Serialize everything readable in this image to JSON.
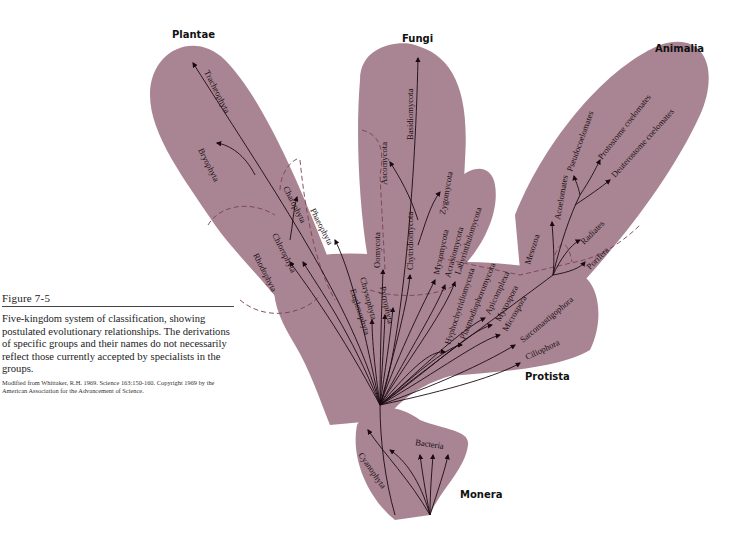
{
  "figure": {
    "title": "Figure 7-5",
    "caption": "Five-kingdom system of classification, showing postulated evolutionary relationships. The derivations of specific groups and their names do not necessarily reflect those currently accepted by specialists in the groups.",
    "source": "Modified from Whittaker, R.H. 1969. Science 163:150-160. Copyright 1969 by the American Association for the Advancement of Science."
  },
  "colors": {
    "kingdom_fill": "#a98593",
    "branch_line": "#1a0a10",
    "boundary_dash": "#7a4050"
  },
  "kingdoms": {
    "plantae": "Plantae",
    "fungi": "Fungi",
    "animalia": "Animalia",
    "protista": "Protista",
    "monera": "Monera"
  },
  "taxa": {
    "plantae": [
      "Tracheophyta",
      "Bryophyta",
      "Charophyta",
      "Chlorophyta",
      "Rhodophyta",
      "Phaeophyta"
    ],
    "fungi": [
      "Basidiomycota",
      "Ascomycota",
      "Zygomycota",
      "Chytridiomycota",
      "Oomycota"
    ],
    "fungi_like": [
      "Myxomycota",
      "Acrasiomycota",
      "Labyrinthulomycota"
    ],
    "protista": [
      "Euglenophyta",
      "Chrysophyta",
      "Pyrrophyta",
      "Hyphochytridiomycota",
      "Plasmodiophoromycota",
      "Apicomplexa",
      "Myxospora",
      "Microspora",
      "Sarcomastigophora",
      "Ciliophora"
    ],
    "animalia": [
      "Acoelomates",
      "Pseudocoelomates",
      "Protostome coelomates",
      "Deuterostome coelomates",
      "Radiates",
      "Porifera",
      "Mesozoa"
    ],
    "monera": [
      "Cyanophyta",
      "Bacteria"
    ]
  }
}
